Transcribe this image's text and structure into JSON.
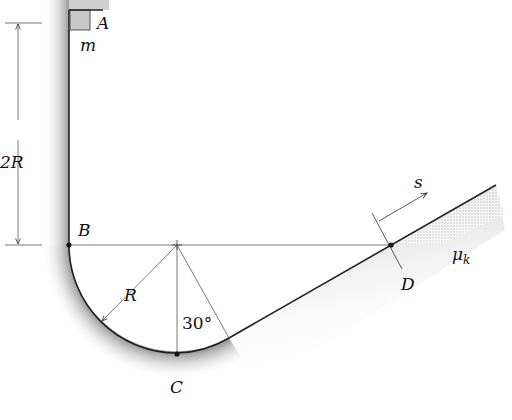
{
  "figure": {
    "labels": {
      "A": "A",
      "m": "m",
      "B": "B",
      "C": "C",
      "D": "D",
      "R": "R",
      "height": "2R",
      "angle": "30°",
      "s": "s",
      "mu": "μ",
      "mu_sub": "k"
    },
    "colors": {
      "line": "#222222",
      "shade": "#bdbdbd",
      "block": "#c8c8c8"
    }
  }
}
